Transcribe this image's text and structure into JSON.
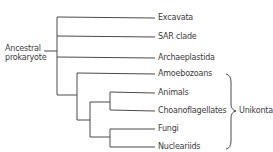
{
  "diagram": {
    "root_label_line1": "Ancestral",
    "root_label_line2": "prokaryote",
    "taxa": [
      {
        "name": "Excavata"
      },
      {
        "name": "SAR clade"
      },
      {
        "name": "Archaeplastida"
      },
      {
        "name": "Amoebozoans"
      },
      {
        "name": "Animals"
      },
      {
        "name": "Choanoflagellates"
      },
      {
        "name": "Fungi"
      },
      {
        "name": "Nucleariids"
      }
    ],
    "group_label": "Unikonta",
    "line_color": "#4a4a4a"
  }
}
